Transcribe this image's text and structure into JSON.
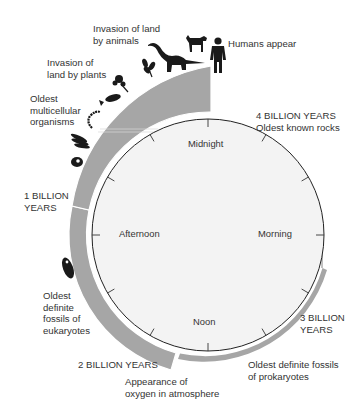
{
  "diagram": {
    "type": "geologic-clock",
    "colors": {
      "band": "#a6a6a6",
      "band_edge": "#8f8f8f",
      "clock_face": "#f3f3f3",
      "clock_outline": "#222222",
      "text": "#333333",
      "silhouette": "#1a1a1a"
    },
    "clock": {
      "labels": {
        "top": "Midnight",
        "right": "Morning",
        "bottom": "Noon",
        "left": "Afternoon"
      },
      "tick_count": 12
    },
    "milestones": {
      "four_billion": "4 BILLION YEARS",
      "oldest_rocks": "Oldest known rocks",
      "three_billion": "3 BILLION\nYEARS",
      "prokaryotes": "Oldest definite fossils\nof prokaryotes",
      "two_billion": "2 BILLION YEARS",
      "oxygen": "Appearance of\noxygen in atmosphere",
      "eukaryotes": "Oldest\ndefinite\nfossils of\neukaryotes",
      "one_billion": "1 BILLION\nYEARS",
      "multicellular": "Oldest\nmulticellular\norganisms",
      "plants": "Invasion of\nland by plants",
      "animals": "Invasion of land\nby animals",
      "humans": "Humans appear"
    },
    "icons": [
      "eukaryote-cell-icon",
      "multicellular-algae-icon",
      "colonial-cell-icon",
      "worm-icon",
      "fish-icon",
      "plant-icon",
      "fern-icon",
      "dinosaur-icon",
      "dog-icon",
      "human-icon"
    ]
  }
}
